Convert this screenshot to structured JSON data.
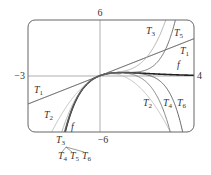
{
  "chart_data": {
    "type": "line",
    "title": "",
    "xlabel": "",
    "ylabel": "",
    "xlim": [
      -3,
      4
    ],
    "ylim": [
      -6,
      6
    ],
    "grid": false,
    "tick_labels": {
      "x_min": "−3",
      "x_max": "4",
      "y_max": "6",
      "y_min": "−6"
    },
    "function": "f(x) = x·e^(−x)",
    "series": [
      {
        "name": "f",
        "coeffs": null,
        "color": "#222222",
        "width": 1.6
      },
      {
        "name": "T1",
        "coeffs": [
          0,
          1
        ],
        "color": "#333333",
        "width": 0.9
      },
      {
        "name": "T2",
        "coeffs": [
          0,
          1,
          -1
        ],
        "color": "#bbbbbb",
        "width": 0.9
      },
      {
        "name": "T3",
        "coeffs": [
          0,
          1,
          -1,
          0.5
        ],
        "color": "#aaaaaa",
        "width": 0.9
      },
      {
        "name": "T4",
        "coeffs": [
          0,
          1,
          -1,
          0.5,
          -0.16667
        ],
        "color": "#777777",
        "width": 0.9
      },
      {
        "name": "T5",
        "coeffs": [
          0,
          1,
          -1,
          0.5,
          -0.16667,
          0.041667
        ],
        "color": "#666666",
        "width": 0.9
      },
      {
        "name": "T6",
        "coeffs": [
          0,
          1,
          -1,
          0.5,
          -0.16667,
          0.041667,
          -0.0083333
        ],
        "color": "#555555",
        "width": 0.9
      }
    ],
    "annotations": [
      {
        "text": "T",
        "sub": "3",
        "x": 146,
        "y": 34
      },
      {
        "text": "T",
        "sub": "5",
        "x": 174,
        "y": 36
      },
      {
        "text": "T",
        "sub": "1",
        "x": 180,
        "y": 54
      },
      {
        "text": "f",
        "x": 177,
        "y": 68
      },
      {
        "text": "T",
        "sub": "1",
        "x": 34,
        "y": 93
      },
      {
        "text": "T",
        "sub": "2",
        "x": 44,
        "y": 118
      },
      {
        "text": "f",
        "x": 71,
        "y": 130
      },
      {
        "text": "T",
        "sub": "2",
        "x": 143,
        "y": 106
      },
      {
        "text": "T",
        "sub": "4",
        "x": 163,
        "y": 106
      },
      {
        "text": "T",
        "sub": "6",
        "x": 177,
        "y": 106
      },
      {
        "text": "T",
        "sub": "3",
        "x": 56,
        "y": 143
      },
      {
        "text": "T",
        "sub": "4",
        "x": 58,
        "y": 159
      },
      {
        "text": "T",
        "sub": "5",
        "x": 70,
        "y": 159
      },
      {
        "text": "T",
        "sub": "6",
        "x": 82,
        "y": 159
      }
    ]
  }
}
